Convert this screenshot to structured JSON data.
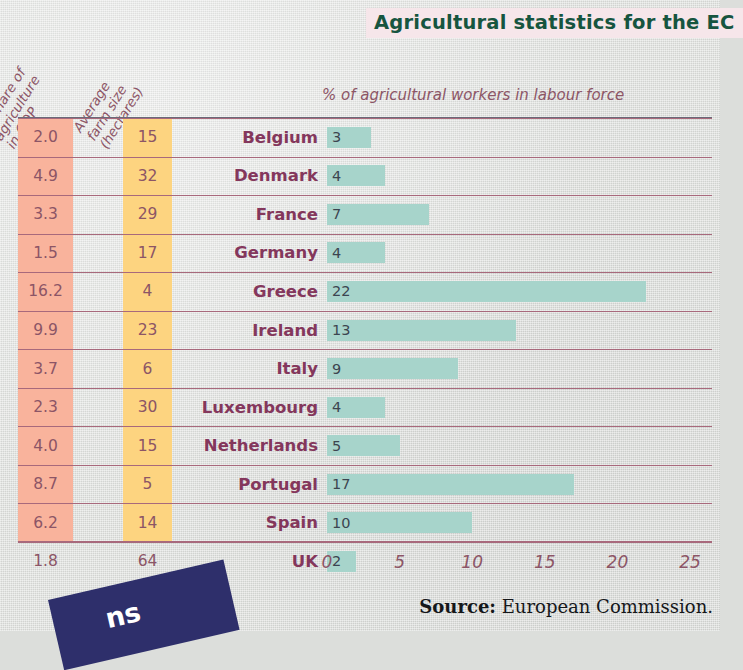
{
  "chart_data": {
    "type": "bar",
    "title": "Agricultural statistics for the EC",
    "xlabel": "% of agricultural workers in labour force",
    "ylabel": "",
    "xlim": [
      0,
      25
    ],
    "xticks": [
      0,
      5,
      10,
      15,
      20,
      25
    ],
    "grid": false,
    "legend": "none",
    "orientation": "horizontal",
    "categories": [
      "Belgium",
      "Denmark",
      "France",
      "Germany",
      "Greece",
      "Ireland",
      "Italy",
      "Luxembourg",
      "Netherlands",
      "Portugal",
      "Spain",
      "UK"
    ],
    "values": [
      3,
      4,
      7,
      4,
      22,
      13,
      9,
      4,
      5,
      17,
      10,
      2
    ],
    "series": [
      {
        "name": "% of agricultural workers in labour force",
        "values": [
          3,
          4,
          7,
          4,
          22,
          13,
          9,
          4,
          5,
          17,
          10,
          2
        ]
      },
      {
        "name": "% share of agriculture in GDP",
        "values": [
          2.0,
          4.9,
          3.3,
          1.5,
          16.2,
          9.9,
          3.7,
          2.3,
          4.0,
          8.7,
          6.2,
          1.8
        ]
      },
      {
        "name": "Average farm size (hectares)",
        "values": [
          15,
          32,
          29,
          17,
          4,
          23,
          6,
          30,
          15,
          5,
          14,
          64
        ]
      }
    ],
    "annotations": [
      "Source: European Commission."
    ]
  },
  "title": "Agricultural statistics for the EC",
  "columns": {
    "gdp_header": "% share of\nagriculture\nin GDP",
    "gdp_header_lines": [
      "% share of",
      "agriculture",
      "in GDP"
    ],
    "farm_header_lines": [
      "Average",
      "farm size",
      "(hectares)"
    ],
    "bars_header": "% of agricultural workers in labour force"
  },
  "rows": [
    {
      "gdp": "2.0",
      "farm": "15",
      "country": "Belgium",
      "bar": "3",
      "value": 3
    },
    {
      "gdp": "4.9",
      "farm": "32",
      "country": "Denmark",
      "bar": "4",
      "value": 4
    },
    {
      "gdp": "3.3",
      "farm": "29",
      "country": "France",
      "bar": "7",
      "value": 7
    },
    {
      "gdp": "1.5",
      "farm": "17",
      "country": "Germany",
      "bar": "4",
      "value": 4
    },
    {
      "gdp": "16.2",
      "farm": "4",
      "country": "Greece",
      "bar": "22",
      "value": 22
    },
    {
      "gdp": "9.9",
      "farm": "23",
      "country": "Ireland",
      "bar": "13",
      "value": 13
    },
    {
      "gdp": "3.7",
      "farm": "6",
      "country": "Italy",
      "bar": "9",
      "value": 9
    },
    {
      "gdp": "2.3",
      "farm": "30",
      "country": "Luxembourg",
      "bar": "4",
      "value": 4
    },
    {
      "gdp": "4.0",
      "farm": "15",
      "country": "Netherlands",
      "bar": "5",
      "value": 5
    },
    {
      "gdp": "8.7",
      "farm": "5",
      "country": "Portugal",
      "bar": "17",
      "value": 17
    },
    {
      "gdp": "6.2",
      "farm": "14",
      "country": "Spain",
      "bar": "10",
      "value": 10
    },
    {
      "gdp": "1.8",
      "farm": "64",
      "country": "UK",
      "bar": "2",
      "value": 2
    }
  ],
  "xticks": [
    "0",
    "5",
    "10",
    "15",
    "20",
    "25"
  ],
  "source": {
    "label": "Source:",
    "text": "European Commission."
  },
  "corner_banner": {
    "text": "ns"
  },
  "colors": {
    "page_background": "#dcdedb",
    "title_background": "#f6e6ea",
    "title_text": "#16553f",
    "gdp_band": "#f9b39c",
    "farm_band": "#fdd480",
    "bar_fill": "#a7d4cb",
    "country_text": "#84375c",
    "number_text": "#8c5566",
    "rule_line": "#a8697c",
    "banner": "#2e2f6b"
  }
}
